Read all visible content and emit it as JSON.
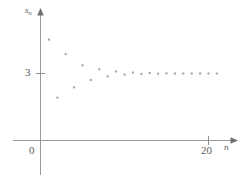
{
  "chart_data": {
    "type": "scatter",
    "title": "",
    "xlabel": "n",
    "ylabel": "s_n",
    "ylabel_base": "s",
    "ylabel_sub": "n",
    "xlim": [
      0,
      23
    ],
    "ylim": [
      0,
      5.1
    ],
    "grid": false,
    "legend": null,
    "x_ticks": [
      {
        "value": 20,
        "label": "20"
      }
    ],
    "y_ticks": [
      {
        "value": 3,
        "label": "3"
      }
    ],
    "origin_label": "0",
    "limit_value": 3,
    "marker": "small-square",
    "marker_color": "#a7a7a7",
    "axis_color": "#9a9a9a",
    "x": [
      1,
      2,
      3,
      4,
      5,
      6,
      7,
      8,
      9,
      10,
      11,
      12,
      13,
      14,
      15,
      16,
      17,
      18,
      19,
      20,
      21
    ],
    "values": [
      4.52,
      1.92,
      3.87,
      2.38,
      3.37,
      2.71,
      3.19,
      2.87,
      3.09,
      2.95,
      3.04,
      2.98,
      3.02,
      2.99,
      3.01,
      3.0,
      3.0,
      3.0,
      3.0,
      3.0,
      3.0
    ],
    "points": [
      {
        "n": 1,
        "s": 4.52
      },
      {
        "n": 2,
        "s": 1.92
      },
      {
        "n": 3,
        "s": 3.87
      },
      {
        "n": 4,
        "s": 2.38
      },
      {
        "n": 5,
        "s": 3.37
      },
      {
        "n": 6,
        "s": 2.71
      },
      {
        "n": 7,
        "s": 3.19
      },
      {
        "n": 8,
        "s": 2.87
      },
      {
        "n": 9,
        "s": 3.09
      },
      {
        "n": 10,
        "s": 2.95
      },
      {
        "n": 11,
        "s": 3.04
      },
      {
        "n": 12,
        "s": 2.98
      },
      {
        "n": 13,
        "s": 3.02
      },
      {
        "n": 14,
        "s": 2.99
      },
      {
        "n": 15,
        "s": 3.01
      },
      {
        "n": 16,
        "s": 3.0
      },
      {
        "n": 17,
        "s": 3.0
      },
      {
        "n": 18,
        "s": 3.0
      },
      {
        "n": 19,
        "s": 3.0
      },
      {
        "n": 20,
        "s": 3.0
      },
      {
        "n": 21,
        "s": 3.0
      }
    ]
  }
}
